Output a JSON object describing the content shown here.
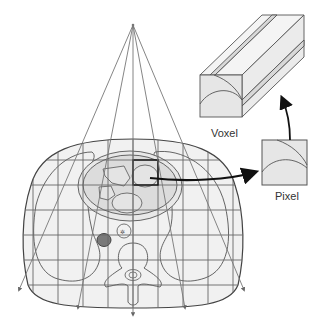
{
  "diagram": {
    "labels": {
      "voxel": "Voxel",
      "pixel": "Pixel"
    },
    "colors": {
      "body_fill": "#f1f1f1",
      "organ_fill": "#dcdcdc",
      "line": "#555555",
      "arrow": "#111111",
      "dark_vessel": "#7a7a7a"
    },
    "grid": {
      "columns_x": [
        33,
        58,
        83,
        108,
        133,
        158,
        183,
        208,
        233
      ],
      "rows_y": [
        160,
        185,
        210,
        235,
        260,
        285
      ]
    },
    "fan": {
      "apex": [
        133,
        25
      ],
      "ray_ends": [
        [
          19,
          290
        ],
        [
          78,
          308
        ],
        [
          133,
          315
        ],
        [
          185,
          308
        ],
        [
          244,
          290
        ]
      ]
    }
  }
}
